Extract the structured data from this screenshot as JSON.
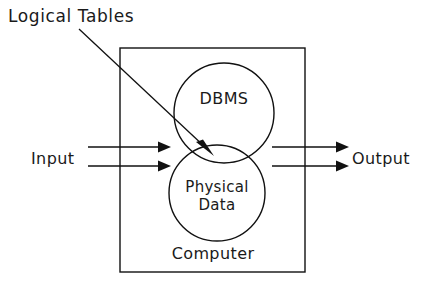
{
  "diagram": {
    "title_callout": "Logical Tables",
    "container_label": "Computer",
    "input_label": "Input",
    "output_label": "Output",
    "nodes": [
      {
        "id": "dbms",
        "label": "DBMS"
      },
      {
        "id": "physical-data",
        "label_line1": "Physical",
        "label_line2": "Data"
      }
    ],
    "colors": {
      "stroke": "#111111",
      "text": "#1a1a1a",
      "background": "#ffffff"
    },
    "icons": {
      "input_arrow": "arrow-right-icon",
      "output_arrow": "arrow-right-icon",
      "callout_pointer": "arrow-pointer-icon"
    }
  }
}
